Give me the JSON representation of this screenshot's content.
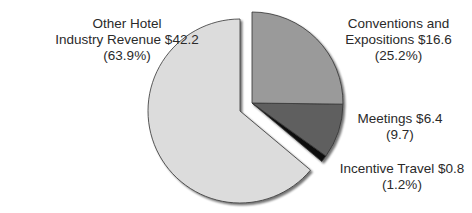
{
  "chart_data": {
    "type": "pie",
    "title": "",
    "exploded": [
      "Conventions and Expositions",
      "Meetings",
      "Incentive Travel"
    ],
    "units": "$ (billions implied)",
    "categories": [
      "Other Hotel Industry Revenue",
      "Conventions and Expositions",
      "Meetings",
      "Incentive Travel"
    ],
    "values": [
      42.2,
      16.6,
      6.4,
      0.8
    ],
    "percents": [
      63.9,
      25.2,
      9.7,
      1.2
    ],
    "colors": [
      "#dcdcdc",
      "#9a9a9a",
      "#5e5e5e",
      "#111111"
    ],
    "labels": [
      {
        "line1": "Other Hotel",
        "line2": "Industry Revenue $42.2",
        "line3": "(63.9%)"
      },
      {
        "line1": "Conventions and",
        "line2": "Expositions $16.6",
        "line3": "(25.2%)"
      },
      {
        "line1": "Meetings $6.4",
        "line2": "(9.7)"
      },
      {
        "line1": "Incentive Travel $0.8",
        "line2": "(1.2%)"
      }
    ],
    "legend": "none (direct labels)"
  }
}
